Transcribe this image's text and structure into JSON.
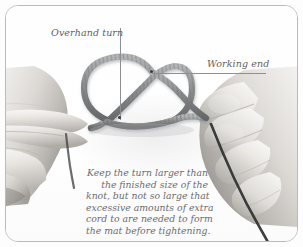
{
  "figure": {
    "frame_border_color": "#b9babc",
    "background_color": "#ffffff"
  },
  "annotations": [
    {
      "id": "overhand-turn",
      "label": "Overhand turn",
      "leader": "vertical",
      "color": "#5e5f61"
    },
    {
      "id": "working-end",
      "label": "Working end",
      "leader": "horizontal-underline",
      "color": "#5e5f61"
    }
  ],
  "labels": {
    "overhand_turn": "Overhand turn",
    "working_end": "Working end"
  },
  "caption": {
    "color": "#6a6b6d",
    "lines": [
      "Keep the turn larger than",
      "the finished size of the",
      "knot, but not so large that",
      "excessive amounts of extra",
      "cord to are needed to form",
      "the mat before tightening."
    ],
    "line_1": "Keep the turn larger than",
    "line_2": "the finished size of the",
    "line_3": "knot, but not so large that",
    "line_4": "excessive amounts of extra",
    "line_5": "cord to are needed to form",
    "line_6": "the mat before tightening."
  },
  "photo": {
    "subject": "two hands holding a grey braided cord formed into an overhand loop",
    "rope_color": "#8a8c8e",
    "cord_color": "#2e2f31",
    "skin_tone": "#d8d5d1"
  }
}
